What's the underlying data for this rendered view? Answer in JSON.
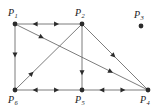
{
  "figure": {
    "type": "directed-graph",
    "width": 161,
    "height": 112,
    "background_color": "#ffffff",
    "stroke_color": "#6e6e6e",
    "vertex_color": "#2b2b2b",
    "label_color": "#1a1a1a",
    "vertex_radius": 2.4,
    "edge_width": 0.9
  },
  "vertices": [
    {
      "id": "P1",
      "label_base": "P",
      "label_sub": "1",
      "x": 15,
      "y": 24,
      "label_x": 8,
      "label_y": 8,
      "isolated": false
    },
    {
      "id": "P2",
      "label_base": "P",
      "label_sub": "2",
      "x": 82,
      "y": 24,
      "label_x": 75,
      "label_y": 8,
      "isolated": false
    },
    {
      "id": "P3",
      "label_base": "P",
      "label_sub": "3",
      "x": 141,
      "y": 26,
      "label_x": 134,
      "label_y": 10,
      "isolated": true
    },
    {
      "id": "P4",
      "label_base": "P",
      "label_sub": "4",
      "x": 148,
      "y": 90,
      "label_x": 140,
      "label_y": 95,
      "isolated": false
    },
    {
      "id": "P5",
      "label_base": "P",
      "label_sub": "5",
      "x": 82,
      "y": 90,
      "label_x": 75,
      "label_y": 95,
      "isolated": false
    },
    {
      "id": "P6",
      "label_base": "P",
      "label_sub": "6",
      "x": 15,
      "y": 90,
      "label_x": 8,
      "label_y": 95,
      "isolated": false
    }
  ],
  "edges": [
    {
      "id": "e-p1-p2",
      "from": "P1",
      "to": "P2",
      "bidirectional": true,
      "arrows": [
        {
          "t": 0.3,
          "dir": "backward"
        },
        {
          "t": 0.62,
          "dir": "forward"
        }
      ]
    },
    {
      "id": "e-p6-p5",
      "from": "P6",
      "to": "P5",
      "bidirectional": true,
      "arrows": [
        {
          "t": 0.3,
          "dir": "backward"
        },
        {
          "t": 0.62,
          "dir": "forward"
        }
      ]
    },
    {
      "id": "e-p5-p4",
      "from": "P5",
      "to": "P4",
      "bidirectional": true,
      "arrows": [
        {
          "t": 0.3,
          "dir": "backward"
        },
        {
          "t": 0.62,
          "dir": "forward"
        }
      ]
    },
    {
      "id": "e-p1-p6",
      "from": "P1",
      "to": "P6",
      "bidirectional": false,
      "arrows": [
        {
          "t": 0.47,
          "dir": "forward"
        }
      ]
    },
    {
      "id": "e-p2-p5",
      "from": "P2",
      "to": "P5",
      "bidirectional": false,
      "arrows": [
        {
          "t": 0.74,
          "dir": "forward"
        }
      ]
    },
    {
      "id": "e-p1-p4",
      "from": "P1",
      "to": "P4",
      "bidirectional": false,
      "arrows": [
        {
          "t": 0.2,
          "dir": "forward"
        },
        {
          "t": 0.72,
          "dir": "forward"
        }
      ]
    },
    {
      "id": "e-p6-p2",
      "from": "P6",
      "to": "P2",
      "bidirectional": false,
      "arrows": [
        {
          "t": 0.25,
          "dir": "forward"
        }
      ]
    },
    {
      "id": "e-p2-p4",
      "from": "P2",
      "to": "P4",
      "bidirectional": false,
      "arrows": [
        {
          "t": 0.48,
          "dir": "forward"
        }
      ]
    }
  ]
}
